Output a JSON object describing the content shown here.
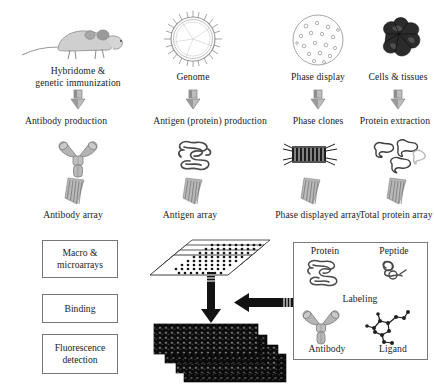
{
  "figure": {
    "background": "#ffffff",
    "ink": "#1b1b1b",
    "grey_icon": "#8d8d8d",
    "dark_icon": "#232323",
    "box_border": "#777777"
  },
  "row_sources": {
    "items": [
      {
        "icon": "mouse-icon",
        "label_line1": "Hybridome &",
        "label_line2": "genetic immunization",
        "x": 78
      },
      {
        "icon": "genome-circle-icon",
        "label_line1": "Genome",
        "label_line2": "",
        "x": 193
      },
      {
        "icon": "petri-dish-icon",
        "label_line1": "Phase display",
        "label_line2": "",
        "x": 318
      },
      {
        "icon": "tissue-icon",
        "label_line1": "Cells & tissues",
        "label_line2": "",
        "x": 398
      }
    ]
  },
  "row_arrows_1": {
    "icon": "down-arrow-3d-icon",
    "count": 4,
    "positions": [
      78,
      193,
      318,
      398
    ]
  },
  "row_products": {
    "items": [
      {
        "label": "Antibody production",
        "x": 66
      },
      {
        "label": "Antigen (protein) production",
        "x": 186
      },
      {
        "label": "Phase clones",
        "x": 318
      },
      {
        "label": "Protein extraction",
        "x": 395
      }
    ]
  },
  "row_molecules": {
    "items": [
      {
        "icon": "antibody-y-icon",
        "x": 78
      },
      {
        "icon": "protein-coil-icon",
        "x": 193
      },
      {
        "icon": "phage-rod-icon",
        "x": 310
      },
      {
        "icon": "protein-cluster-icon",
        "x": 398
      }
    ]
  },
  "row_arrays": {
    "items": [
      {
        "icon": "array-slide-icon",
        "label": "Antibody array",
        "x": 72
      },
      {
        "icon": "array-slide-icon",
        "label": "Antigen array",
        "x": 190
      },
      {
        "icon": "array-slide-icon",
        "label": "Phase displayed array",
        "x": 318
      },
      {
        "icon": "array-slide-icon",
        "label": "Total protein array",
        "x": 398
      }
    ]
  },
  "process_steps": {
    "items": [
      {
        "line1": "Macro &",
        "line2": "microarrays",
        "top": 240,
        "height": 36
      },
      {
        "line1": "Binding",
        "line2": "",
        "top": 294,
        "height": 27
      },
      {
        "line1": "Fluorescence",
        "line2": "detection",
        "top": 334,
        "height": 38
      }
    ],
    "left": 42,
    "width": 74
  },
  "center_flow": {
    "microarray_stack_icon": "microarray-slide-stack-icon",
    "down_arrow_icon": "thick-down-arrow-icon",
    "left_arrow_icon": "thick-left-arrow-icon",
    "scan_stack_icon": "fluorescence-scan-stack-icon"
  },
  "legend": {
    "center_label": "Labeling",
    "items": [
      {
        "label": "Protein",
        "icon": "protein-coil-icon",
        "corner": "top-left"
      },
      {
        "label": "Peptide",
        "icon": "peptide-icon",
        "corner": "top-right"
      },
      {
        "label": "Antibody",
        "icon": "antibody-y-icon",
        "corner": "bottom-left"
      },
      {
        "label": "Ligand",
        "icon": "ligand-molecule-icon",
        "corner": "bottom-right"
      }
    ],
    "box": {
      "left": 293,
      "top": 242,
      "width": 133,
      "height": 116
    }
  }
}
